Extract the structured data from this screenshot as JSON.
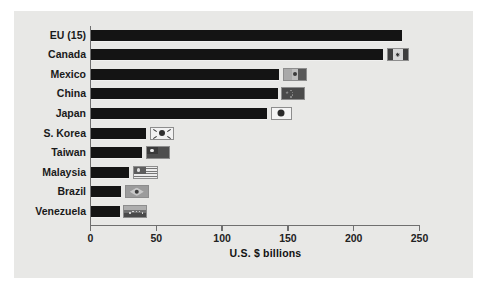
{
  "chart_data": {
    "type": "bar",
    "orientation": "horizontal",
    "title": "",
    "xlabel": "U.S. $ billions",
    "ylabel": "",
    "xlim": [
      0,
      250
    ],
    "xticks": [
      0,
      50,
      100,
      150,
      200,
      250
    ],
    "xtick_labels": [
      "0",
      "50",
      "100",
      "150",
      "200",
      "250"
    ],
    "grid": false,
    "legend": "none",
    "categories": [
      "EU (15)",
      "Canada",
      "Mexico",
      "China",
      "Japan",
      "S. Korea",
      "Taiwan",
      "Malaysia",
      "Brazil",
      "Venezuela"
    ],
    "values": [
      236,
      222,
      143,
      142,
      134,
      42,
      39,
      29,
      23,
      22
    ],
    "bar_color": "#141414",
    "panel_color": "#e8e8e6",
    "axis_color": "#6f6f6f",
    "rows": [
      {
        "label": "EU (15)",
        "value": 236,
        "flag": "flag-eu-none",
        "flag_name": "no-flag-icon"
      },
      {
        "label": "Canada",
        "value": 222,
        "flag": "flag-canada",
        "flag_name": "canada-flag-icon"
      },
      {
        "label": "Mexico",
        "value": 143,
        "flag": "flag-mexico",
        "flag_name": "mexico-flag-icon"
      },
      {
        "label": "China",
        "value": 142,
        "flag": "flag-china",
        "flag_name": "china-flag-icon"
      },
      {
        "label": "Japan",
        "value": 134,
        "flag": "flag-japan",
        "flag_name": "japan-flag-icon"
      },
      {
        "label": "S. Korea",
        "value": 42,
        "flag": "flag-skorea",
        "flag_name": "south-korea-flag-icon"
      },
      {
        "label": "Taiwan",
        "value": 39,
        "flag": "flag-taiwan",
        "flag_name": "taiwan-flag-icon"
      },
      {
        "label": "Malaysia",
        "value": 29,
        "flag": "flag-malaysia",
        "flag_name": "malaysia-flag-icon"
      },
      {
        "label": "Brazil",
        "value": 23,
        "flag": "flag-brazil",
        "flag_name": "brazil-flag-icon"
      },
      {
        "label": "Venezuela",
        "value": 22,
        "flag": "flag-venezuela",
        "flag_name": "venezuela-flag-icon"
      }
    ]
  }
}
